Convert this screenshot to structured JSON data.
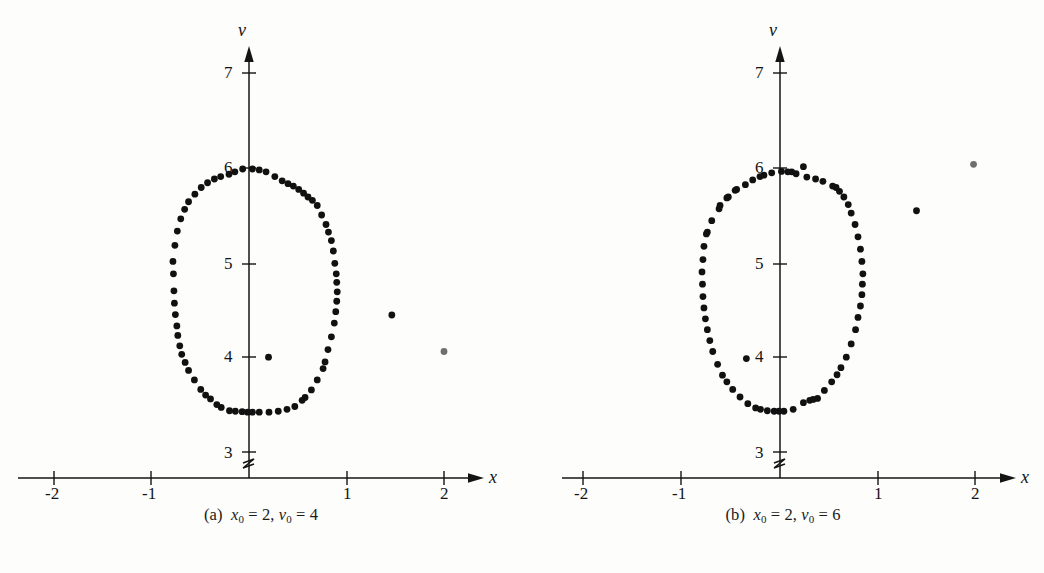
{
  "figure": {
    "width": 1044,
    "height": 573,
    "background": "#fdfdfc",
    "ink_color": "#141414",
    "point_color": "#111111",
    "highlight_point_color": "#6f6f6f"
  },
  "panels": [
    {
      "id": "a",
      "caption": {
        "label": "(a)",
        "x_var": "x",
        "x_sub": "0",
        "x_eq": "= 2,",
        "v_var": "v",
        "v_sub": "0",
        "v_eq": "= 4",
        "full_text": "(a) x0 = 2, v0 = 4"
      },
      "axes": {
        "x_axis_label": "x",
        "y_axis_label": "v",
        "x_ticks": [
          "-2",
          "-1",
          "1",
          "2"
        ],
        "x_tick_values": [
          -2,
          -1,
          1,
          2
        ],
        "y_ticks": [
          "3",
          "4",
          "5",
          "6",
          "7"
        ],
        "y_tick_values": [
          3,
          4,
          5,
          6,
          7
        ],
        "x_range": [
          -2.35,
          2.45
        ],
        "y_range": [
          2.78,
          7.25
        ],
        "axis_break": true,
        "grid": false
      }
    },
    {
      "id": "b",
      "caption": {
        "label": "(b)",
        "x_var": "x",
        "x_sub": "0",
        "x_eq": "= 2,",
        "v_var": "v",
        "v_sub": "0",
        "v_eq": "= 6",
        "full_text": "(b) x0 = 2, v0 = 6"
      },
      "axes": {
        "x_axis_label": "x",
        "y_axis_label": "v",
        "x_ticks": [
          "-2",
          "-1",
          "1",
          "2"
        ],
        "x_tick_values": [
          -2,
          -1,
          1,
          2
        ],
        "y_ticks": [
          "3",
          "4",
          "5",
          "6",
          "7"
        ],
        "y_tick_values": [
          3,
          4,
          5,
          6,
          7
        ],
        "x_range": [
          -2.35,
          2.45
        ],
        "y_range": [
          2.78,
          7.25
        ],
        "axis_break": true,
        "grid": false
      }
    }
  ],
  "chart_data": [
    {
      "type": "scatter",
      "title": "(a) x0 = 2, v0 = 4",
      "xlabel": "x",
      "ylabel": "v",
      "xlim": [
        -2.35,
        2.45
      ],
      "ylim": [
        2.78,
        7.25
      ],
      "grid": false,
      "legend": "none",
      "series": [
        {
          "name": "orbit",
          "color": "#111111",
          "marker": "filled-circle",
          "points": [
            [
              0.035,
              5.985
            ],
            [
              0.105,
              5.975
            ],
            [
              0.175,
              5.955
            ],
            [
              -0.065,
              5.985
            ],
            [
              -0.145,
              5.955
            ],
            [
              -0.205,
              5.93
            ],
            [
              0.265,
              5.905
            ],
            [
              0.34,
              5.86
            ],
            [
              0.4,
              5.83
            ],
            [
              0.455,
              5.805
            ],
            [
              0.51,
              5.77
            ],
            [
              0.56,
              5.73
            ],
            [
              0.605,
              5.69
            ],
            [
              0.65,
              5.655
            ],
            [
              0.7,
              5.6
            ],
            [
              0.745,
              5.5
            ],
            [
              0.79,
              5.4
            ],
            [
              0.815,
              5.32
            ],
            [
              0.845,
              5.23
            ],
            [
              0.865,
              5.12
            ],
            [
              0.88,
              4.99
            ],
            [
              0.895,
              4.88
            ],
            [
              0.9,
              4.79
            ],
            [
              0.905,
              4.69
            ],
            [
              0.9,
              4.59
            ],
            [
              0.89,
              4.48
            ],
            [
              0.875,
              4.36
            ],
            [
              0.845,
              4.215
            ],
            [
              0.81,
              4.08
            ],
            [
              0.78,
              3.95
            ],
            [
              0.76,
              3.88
            ],
            [
              0.7,
              3.76
            ],
            [
              0.64,
              3.655
            ],
            [
              0.575,
              3.575
            ],
            [
              0.545,
              3.545
            ],
            [
              0.47,
              3.48
            ],
            [
              0.39,
              3.45
            ],
            [
              0.3,
              3.43
            ],
            [
              0.205,
              3.42
            ],
            [
              0.105,
              3.42
            ],
            [
              0.035,
              3.42
            ],
            [
              -0.015,
              3.42
            ],
            [
              -0.07,
              3.425
            ],
            [
              -0.14,
              3.43
            ],
            [
              -0.2,
              3.435
            ],
            [
              -0.285,
              3.47
            ],
            [
              -0.33,
              3.5
            ],
            [
              -0.395,
              3.56
            ],
            [
              -0.445,
              3.6
            ],
            [
              -0.495,
              3.66
            ],
            [
              -0.56,
              3.76
            ],
            [
              -0.62,
              3.86
            ],
            [
              -0.655,
              3.945
            ],
            [
              -0.69,
              4.03
            ],
            [
              -0.71,
              4.12
            ],
            [
              -0.73,
              4.23
            ],
            [
              -0.74,
              4.33
            ],
            [
              -0.755,
              4.45
            ],
            [
              -0.765,
              4.57
            ],
            [
              -0.77,
              4.7
            ],
            [
              -0.775,
              4.88
            ],
            [
              -0.78,
              5.01
            ],
            [
              -0.76,
              5.18
            ],
            [
              -0.735,
              5.33
            ],
            [
              -0.7,
              5.46
            ],
            [
              -0.66,
              5.56
            ],
            [
              -0.62,
              5.64
            ],
            [
              -0.555,
              5.72
            ],
            [
              -0.49,
              5.79
            ],
            [
              -0.425,
              5.84
            ],
            [
              -0.355,
              5.88
            ],
            [
              -0.29,
              5.905
            ],
            [
              0.2,
              4.0
            ]
          ]
        },
        {
          "name": "escaping-iterates",
          "color": "#111111",
          "marker": "filled-circle",
          "points": [
            [
              1.465,
              4.445
            ]
          ]
        },
        {
          "name": "initial-condition",
          "color": "#6f6f6f",
          "marker": "filled-circle",
          "points": [
            [
              2.0,
              4.06
            ]
          ]
        }
      ]
    },
    {
      "type": "scatter",
      "title": "(b) x0 = 2, v0 = 6",
      "xlabel": "x",
      "ylabel": "v",
      "xlim": [
        -2.35,
        2.45
      ],
      "ylim": [
        2.78,
        7.25
      ],
      "grid": false,
      "legend": "none",
      "series": [
        {
          "name": "orbit",
          "color": "#111111",
          "marker": "filled-circle",
          "points": [
            [
              0.015,
              5.96
            ],
            [
              0.08,
              5.955
            ],
            [
              0.12,
              5.955
            ],
            [
              0.165,
              5.935
            ],
            [
              0.24,
              6.01
            ],
            [
              0.275,
              5.9
            ],
            [
              -0.085,
              5.945
            ],
            [
              -0.165,
              5.92
            ],
            [
              -0.205,
              5.905
            ],
            [
              -0.28,
              5.87
            ],
            [
              -0.355,
              5.82
            ],
            [
              -0.445,
              5.77
            ],
            [
              -0.46,
              5.76
            ],
            [
              -0.53,
              5.69
            ],
            [
              -0.545,
              5.68
            ],
            [
              -0.615,
              5.6
            ],
            [
              -0.625,
              5.565
            ],
            [
              -0.7,
              5.44
            ],
            [
              -0.745,
              5.32
            ],
            [
              -0.755,
              5.3
            ],
            [
              -0.78,
              5.17
            ],
            [
              -0.79,
              5.03
            ],
            [
              -0.8,
              4.9
            ],
            [
              -0.795,
              4.77
            ],
            [
              -0.79,
              4.64
            ],
            [
              -0.78,
              4.52
            ],
            [
              -0.765,
              4.405
            ],
            [
              -0.745,
              4.29
            ],
            [
              -0.72,
              4.175
            ],
            [
              -0.69,
              4.06
            ],
            [
              -0.64,
              3.925
            ],
            [
              -0.59,
              3.81
            ],
            [
              -0.545,
              3.74
            ],
            [
              -0.485,
              3.66
            ],
            [
              -0.41,
              3.58
            ],
            [
              -0.33,
              3.51
            ],
            [
              -0.25,
              3.465
            ],
            [
              -0.2,
              3.45
            ],
            [
              -0.13,
              3.435
            ],
            [
              -0.06,
              3.43
            ],
            [
              -0.01,
              3.43
            ],
            [
              0.04,
              3.43
            ],
            [
              0.135,
              3.45
            ],
            [
              0.24,
              3.52
            ],
            [
              0.305,
              3.545
            ],
            [
              0.34,
              3.555
            ],
            [
              0.385,
              3.565
            ],
            [
              0.455,
              3.65
            ],
            [
              0.53,
              3.74
            ],
            [
              0.585,
              3.815
            ],
            [
              0.625,
              3.89
            ],
            [
              0.68,
              4.0
            ],
            [
              0.73,
              4.14
            ],
            [
              0.775,
              4.29
            ],
            [
              0.8,
              4.42
            ],
            [
              0.825,
              4.54
            ],
            [
              0.84,
              4.66
            ],
            [
              0.845,
              4.77
            ],
            [
              0.85,
              4.88
            ],
            [
              0.84,
              5.01
            ],
            [
              0.825,
              5.14
            ],
            [
              0.8,
              5.27
            ],
            [
              0.77,
              5.4
            ],
            [
              0.73,
              5.52
            ],
            [
              0.7,
              5.61
            ],
            [
              0.655,
              5.69
            ],
            [
              0.61,
              5.75
            ],
            [
              0.575,
              5.79
            ],
            [
              0.54,
              5.805
            ],
            [
              0.44,
              5.855
            ],
            [
              0.365,
              5.88
            ],
            [
              -0.345,
              3.985
            ]
          ]
        },
        {
          "name": "escaping-iterates",
          "color": "#111111",
          "marker": "filled-circle",
          "points": [
            [
              1.4,
              5.545
            ]
          ]
        },
        {
          "name": "initial-condition",
          "color": "#6f6f6f",
          "marker": "filled-circle",
          "points": [
            [
              1.985,
              6.035
            ]
          ]
        }
      ]
    }
  ]
}
